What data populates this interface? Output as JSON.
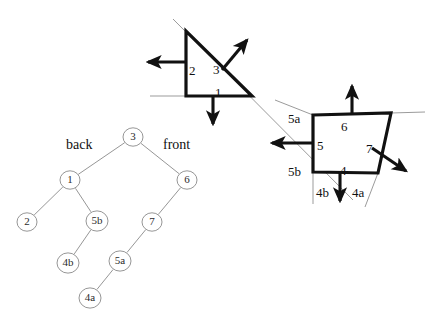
{
  "figure": {
    "colors": {
      "ink": "#111111",
      "thin_line": "#9b9b9b",
      "node_stroke": "#808080",
      "node_text": "#2b2b2b",
      "background": "#ffffff"
    },
    "triangle_region": {
      "name": "back-polygon-triangle",
      "polygon": [
        [
          186,
          31
        ],
        [
          186,
          96
        ],
        [
          252,
          96
        ]
      ],
      "edge_labels": [
        {
          "id": "tri-label-2",
          "text": "2",
          "x": 189,
          "y": 64
        },
        {
          "id": "tri-label-3",
          "text": "3",
          "x": 213,
          "y": 63
        },
        {
          "id": "tri-label-1",
          "text": "1",
          "x": 215,
          "y": 86
        }
      ],
      "normals": [
        {
          "id": "normal-2",
          "label": "2",
          "from": [
            186,
            62
          ],
          "to": [
            148,
            62
          ],
          "dir": "left"
        },
        {
          "id": "normal-3",
          "label": "3",
          "from": [
            222,
            70
          ],
          "to": [
            247,
            40
          ],
          "dir": "up-right"
        },
        {
          "id": "normal-1",
          "label": "1",
          "from": [
            213,
            96
          ],
          "to": [
            213,
            124
          ],
          "dir": "down"
        }
      ]
    },
    "quad_region": {
      "name": "front-polygon-quad",
      "polygon": [
        [
          313,
          115
        ],
        [
          391,
          113
        ],
        [
          378,
          173
        ],
        [
          313,
          172
        ]
      ],
      "edge_labels": [
        {
          "id": "quad-label-5a",
          "text": "5a",
          "x": 288,
          "y": 112
        },
        {
          "id": "quad-label-6",
          "text": "6",
          "x": 341,
          "y": 120
        },
        {
          "id": "quad-label-5",
          "text": "5",
          "x": 317,
          "y": 139
        },
        {
          "id": "quad-label-7",
          "text": "7",
          "x": 366,
          "y": 142
        },
        {
          "id": "quad-label-5b",
          "text": "5b",
          "x": 288,
          "y": 165
        },
        {
          "id": "quad-label-4",
          "text": "4",
          "x": 340,
          "y": 164
        },
        {
          "id": "quad-label-4b",
          "text": "4b",
          "x": 316,
          "y": 186
        },
        {
          "id": "quad-label-4a",
          "text": "4a",
          "x": 352,
          "y": 186
        }
      ],
      "normals": [
        {
          "id": "normal-6",
          "label": "6",
          "from": [
            352,
            114
          ],
          "to": [
            352,
            86
          ],
          "dir": "up"
        },
        {
          "id": "normal-5",
          "label": "5",
          "from": [
            313,
            143
          ],
          "to": [
            272,
            143
          ],
          "dir": "left"
        },
        {
          "id": "normal-7",
          "label": "7",
          "from": [
            372,
            148
          ],
          "to": [
            406,
            171
          ],
          "dir": "down-right"
        },
        {
          "id": "normal-4",
          "label": "4",
          "from": [
            340,
            172
          ],
          "to": [
            340,
            201
          ],
          "dir": "down"
        }
      ]
    },
    "splitting_lines": [
      {
        "id": "split-line-3",
        "from": [
          173,
          19
        ],
        "to": [
          353,
          200
        ],
        "note": "diagonal splitter through plane 3"
      },
      {
        "id": "split-line-1",
        "from": [
          150,
          96
        ],
        "to": [
          186,
          96
        ],
        "note": "horizontal extension of plane 1 left"
      },
      {
        "id": "split-line-6",
        "from": [
          391,
          113
        ],
        "to": [
          425,
          112
        ],
        "note": "horizontal extension of plane 6 right"
      },
      {
        "id": "split-line-5",
        "from": [
          313,
          172
        ],
        "to": [
          313,
          204
        ],
        "note": "vertical extension of plane 5 down"
      },
      {
        "id": "split-line-4a",
        "from": [
          378,
          173
        ],
        "to": [
          365,
          207
        ],
        "note": "extension of edge 4a / 7 down-left"
      },
      {
        "id": "split-line-5a-ext",
        "from": [
          275,
          100
        ],
        "to": [
          313,
          115
        ],
        "note": "extension toward 5a"
      }
    ]
  },
  "tree": {
    "name": "bsp-tree",
    "labels": [
      {
        "id": "tree-label-back",
        "text": "back",
        "x": 66,
        "y": 138
      },
      {
        "id": "tree-label-front",
        "text": "front",
        "x": 163,
        "y": 138
      }
    ],
    "nodes": [
      {
        "id": "node-3",
        "label": "3",
        "x": 133,
        "y": 137,
        "r": 10
      },
      {
        "id": "node-1",
        "label": "1",
        "x": 70,
        "y": 180,
        "r": 10
      },
      {
        "id": "node-6",
        "label": "6",
        "x": 187,
        "y": 180,
        "r": 10
      },
      {
        "id": "node-2",
        "label": "2",
        "x": 27,
        "y": 222,
        "r": 10
      },
      {
        "id": "node-5b",
        "label": "5b",
        "x": 97,
        "y": 221,
        "r": 11
      },
      {
        "id": "node-7",
        "label": "7",
        "x": 152,
        "y": 222,
        "r": 10
      },
      {
        "id": "node-4b",
        "label": "4b",
        "x": 68,
        "y": 263,
        "r": 11
      },
      {
        "id": "node-5a",
        "label": "5a",
        "x": 120,
        "y": 261,
        "r": 11
      },
      {
        "id": "node-4a",
        "label": "4a",
        "x": 90,
        "y": 298,
        "r": 11
      }
    ],
    "edges": [
      {
        "id": "edge-3-1",
        "from": "node-3",
        "to": "node-1"
      },
      {
        "id": "edge-3-6",
        "from": "node-3",
        "to": "node-6"
      },
      {
        "id": "edge-1-2",
        "from": "node-1",
        "to": "node-2"
      },
      {
        "id": "edge-1-5b",
        "from": "node-1",
        "to": "node-5b"
      },
      {
        "id": "edge-6-7",
        "from": "node-6",
        "to": "node-7"
      },
      {
        "id": "edge-5b-4b",
        "from": "node-5b",
        "to": "node-4b"
      },
      {
        "id": "edge-7-5a",
        "from": "node-7",
        "to": "node-5a"
      },
      {
        "id": "edge-5a-4a",
        "from": "node-5a",
        "to": "node-4a"
      }
    ]
  }
}
